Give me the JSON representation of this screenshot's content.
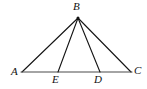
{
  "figure": {
    "kind": "geometry-diagram",
    "background_color": "#ffffff",
    "stroke_color": "#141414",
    "base_stroke_color": "#4a4a4a",
    "stroke_width": 1,
    "width": 147,
    "height": 89
  },
  "points": {
    "A": {
      "label": "A",
      "x": 22,
      "y": 72,
      "label_x": 11,
      "label_y": 67
    },
    "B": {
      "label": "B",
      "x": 78,
      "y": 18,
      "label_x": 73,
      "label_y": 2
    },
    "C": {
      "label": "C",
      "x": 131,
      "y": 72,
      "label_x": 134,
      "label_y": 66
    },
    "D": {
      "label": "D",
      "x": 100,
      "y": 72,
      "label_x": 94,
      "label_y": 75
    },
    "E": {
      "label": "E",
      "x": 58,
      "y": 72,
      "label_x": 52,
      "label_y": 75
    }
  },
  "segments": [
    {
      "name": "side-AB",
      "from": "A",
      "to": "B"
    },
    {
      "name": "side-BC",
      "from": "B",
      "to": "C"
    },
    {
      "name": "base-AC",
      "from": "A",
      "to": "C"
    },
    {
      "name": "cevian-BE",
      "from": "B",
      "to": "E"
    },
    {
      "name": "cevian-BD",
      "from": "B",
      "to": "D"
    }
  ]
}
